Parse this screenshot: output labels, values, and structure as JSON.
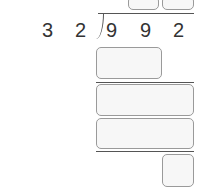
{
  "problem": {
    "divisor": [
      "3",
      "2"
    ],
    "dividend": [
      "9",
      "9",
      "2"
    ]
  },
  "answer_boxes": {
    "quotient_tens": "",
    "quotient_ones": "",
    "step1_product": "",
    "step1_remainder": "",
    "step2_product": "",
    "remainder": ""
  }
}
